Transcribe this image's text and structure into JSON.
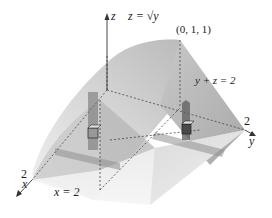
{
  "figure": {
    "type": "3d-solid-region",
    "labels": {
      "z_axis": "z",
      "x_axis": "x",
      "y_axis": "y",
      "curve_surface": "z = √y",
      "point": "(0, 1, 1)",
      "plane": "y + z = 2",
      "x_plane": "x = 2",
      "x_tick": "2",
      "y_tick": "2"
    },
    "colors": {
      "surface_light": "#e8e8e8",
      "surface_mid": "#cfcfcf",
      "surface_dark": "#a8a8a8",
      "plane_face": "#bdbdbd",
      "slab": "#6e6e6e",
      "strip": "#9a9a9a",
      "axis": "#333333",
      "dashed": "#444444"
    }
  }
}
